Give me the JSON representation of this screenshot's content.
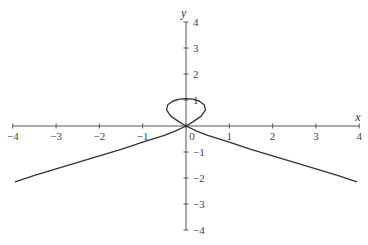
{
  "chart_data": {
    "type": "line",
    "title": "",
    "xlabel": "x",
    "ylabel": "y",
    "xlim": [
      -4,
      4
    ],
    "ylim": [
      -4,
      4
    ],
    "grid": false,
    "x_ticks": [
      -4,
      -3,
      -2,
      -1,
      0,
      1,
      2,
      3,
      4
    ],
    "y_ticks": [
      -4,
      -3,
      -2,
      -1,
      1,
      2,
      3,
      4
    ],
    "series": [
      {
        "name": "left-branch",
        "x": [
          0,
          -0.25,
          -0.5,
          -1,
          -1.5,
          -2,
          -2.5,
          -3,
          -3.5,
          -3.95
        ],
        "y": [
          0,
          -0.2,
          -0.36,
          -0.62,
          -0.9,
          -1.15,
          -1.4,
          -1.65,
          -1.9,
          -2.15
        ]
      },
      {
        "name": "right-branch",
        "x": [
          0,
          0.25,
          0.5,
          1,
          1.5,
          2,
          2.5,
          3,
          3.5,
          3.95
        ],
        "y": [
          0,
          -0.2,
          -0.36,
          -0.62,
          -0.9,
          -1.15,
          -1.4,
          -1.65,
          -1.9,
          -2.15
        ]
      },
      {
        "name": "loop",
        "x": [
          0,
          -0.15,
          -0.35,
          -0.45,
          -0.42,
          -0.3,
          -0.15,
          0,
          0.15,
          0.3,
          0.42,
          0.45,
          0.35,
          0.15,
          0
        ],
        "y": [
          0,
          0.15,
          0.38,
          0.62,
          0.82,
          0.96,
          1.03,
          1.05,
          1.03,
          0.96,
          0.82,
          0.62,
          0.38,
          0.15,
          0
        ]
      }
    ]
  }
}
